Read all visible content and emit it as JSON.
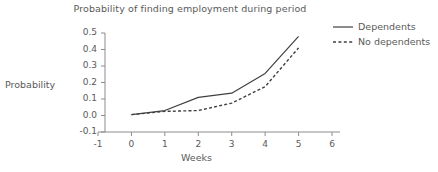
{
  "chart_data": {
    "type": "line",
    "title": "Probability of finding employment during period",
    "xlabel": "Weeks",
    "ylabel": "Probability",
    "xlim": [
      -1,
      6
    ],
    "ylim": [
      -0.1,
      0.5
    ],
    "xticks": [
      "-1",
      "0",
      "1",
      "2",
      "3",
      "4",
      "5",
      "6"
    ],
    "xtick_values": [
      -1,
      0,
      1,
      2,
      3,
      4,
      5,
      6
    ],
    "yticks": [
      "-0.1",
      "0.0",
      "0.1",
      "0.2",
      "0.3",
      "0.4",
      "0.5"
    ],
    "ytick_values": [
      -0.1,
      0.0,
      0.1,
      0.2,
      0.3,
      0.4,
      0.5
    ],
    "grid": false,
    "legend_position": "top-right",
    "x": [
      0,
      1,
      2,
      3,
      4,
      5
    ],
    "series": [
      {
        "name": "Dependents",
        "style": "solid",
        "color": "#404040",
        "values": [
          0.005,
          0.03,
          0.11,
          0.135,
          0.255,
          0.48
        ]
      },
      {
        "name": "No dependents",
        "style": "dashed",
        "color": "#404040",
        "values": [
          0.005,
          0.025,
          0.03,
          0.075,
          0.175,
          0.41
        ]
      }
    ]
  },
  "axis_colors": {
    "axis_line": "#8c8c8c",
    "text": "#5a5a5a"
  }
}
